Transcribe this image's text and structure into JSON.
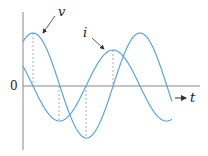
{
  "diagram": {
    "title": "",
    "type": "sinusoidal waveforms (voltage and current)",
    "axes": {
      "origin_label": "0",
      "x_label": "t"
    },
    "curves": [
      {
        "name": "v",
        "label": "v",
        "color": "#5aa6d6",
        "amplitude_px": 52.5,
        "peak_x_px": 33
      },
      {
        "name": "i",
        "label": "i",
        "color": "#5aa6d6",
        "amplitude_px": 35.5,
        "peak_x_px": 113
      }
    ],
    "colors": {
      "curve": "#5aa6d6",
      "axis": "#888888",
      "dashed": "#999999",
      "text": "#222222"
    }
  }
}
